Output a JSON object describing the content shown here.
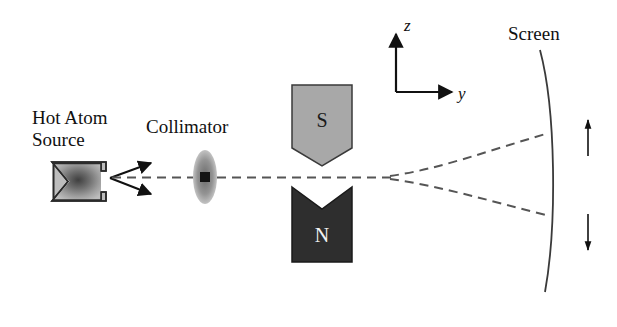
{
  "figure": {
    "background_color": "#ffffff",
    "stroke_color": "#1a1a1a"
  },
  "labels": {
    "source_line1": "Hot Atom",
    "source_line2": "Source",
    "collimator": "Collimator",
    "screen": "Screen",
    "pole_south": "S",
    "pole_north": "N",
    "axis_z": "z",
    "axis_y": "y",
    "spin_up": "↑",
    "spin_down": "↓"
  },
  "colors": {
    "south_pole_fill": "#a8a8a8",
    "south_pole_stroke": "#3a3a3a",
    "north_pole_fill": "#2e2e2e",
    "north_pole_stroke": "#1a1a1a",
    "source_fill_center": "#4a4a4a",
    "source_fill_edge": "#b4b4b4",
    "source_stroke": "#2a2a2a",
    "collimator_fill": "#8c8c8c",
    "collimator_aperture": "#141414",
    "beam_dash": "#555555",
    "screen_stroke": "#3a3a3a",
    "arrow_fill": "#111111"
  },
  "geometry": {
    "beam_axis_y": 177,
    "split_origin_x": 390,
    "screen_hit_upper_y": 133,
    "screen_hit_lower_y": 215
  }
}
